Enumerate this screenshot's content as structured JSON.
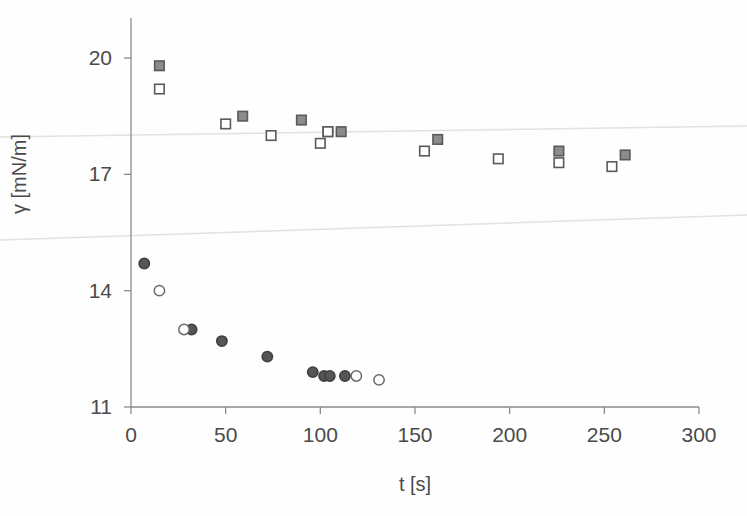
{
  "chart_data": {
    "type": "scatter",
    "title": "",
    "subtitle": "",
    "xlabel": "t [s]",
    "ylabel": "γ [mN/m]",
    "xlim": [
      0,
      300
    ],
    "ylim": [
      11,
      20
    ],
    "xticks": [
      0,
      50,
      100,
      150,
      200,
      250,
      300
    ],
    "yticks": [
      11,
      14,
      17,
      20
    ],
    "xtick_labels": [
      "0",
      "50",
      "100",
      "150",
      "200",
      "250",
      "300"
    ],
    "ytick_labels": [
      "11",
      "14",
      "17",
      "20"
    ],
    "grid": false,
    "legend": "none",
    "axis_color": "#8a8a8a",
    "marker_fill_color": "#8c8c8c",
    "marker_edge_color": "#5a5a5a",
    "marker_open_color": "#ffffff",
    "artifact_line_color": "#e2e2e2",
    "series": [
      {
        "name": "filled-squares",
        "marker": "square",
        "fill": "gray",
        "points": [
          {
            "x": 15.0,
            "y": 19.8
          },
          {
            "x": 59.0,
            "y": 18.5
          },
          {
            "x": 90.0,
            "y": 18.4
          },
          {
            "x": 104.0,
            "y": 18.1
          },
          {
            "x": 111.0,
            "y": 18.1
          },
          {
            "x": 162.0,
            "y": 17.9
          },
          {
            "x": 226.0,
            "y": 17.6
          },
          {
            "x": 261.0,
            "y": 17.5
          }
        ]
      },
      {
        "name": "open-squares",
        "marker": "square",
        "fill": "open",
        "points": [
          {
            "x": 15.0,
            "y": 19.2
          },
          {
            "x": 50.0,
            "y": 18.3
          },
          {
            "x": 74.0,
            "y": 18.0
          },
          {
            "x": 100.0,
            "y": 17.8
          },
          {
            "x": 104.0,
            "y": 18.1
          },
          {
            "x": 155.0,
            "y": 17.6
          },
          {
            "x": 194.0,
            "y": 17.4
          },
          {
            "x": 226.0,
            "y": 17.3
          },
          {
            "x": 254.0,
            "y": 17.2
          }
        ]
      },
      {
        "name": "filled-circles",
        "marker": "circle",
        "fill": "gray",
        "points": [
          {
            "x": 7.0,
            "y": 14.7
          },
          {
            "x": 32.0,
            "y": 13.0
          },
          {
            "x": 48.0,
            "y": 12.7
          },
          {
            "x": 72.0,
            "y": 12.3
          },
          {
            "x": 96.0,
            "y": 11.9
          },
          {
            "x": 102.0,
            "y": 11.8
          },
          {
            "x": 105.0,
            "y": 11.8
          },
          {
            "x": 113.0,
            "y": 11.8
          }
        ]
      },
      {
        "name": "open-circles",
        "marker": "circle",
        "fill": "open",
        "points": [
          {
            "x": 15.0,
            "y": 14.0
          },
          {
            "x": 28.0,
            "y": 13.0
          },
          {
            "x": 119.0,
            "y": 11.8
          },
          {
            "x": 131.0,
            "y": 11.7
          }
        ]
      }
    ],
    "artifact_lines": [
      {
        "name": "upper-scan-line",
        "x1_px": 0,
        "y1_px": 137,
        "x2_px": 747,
        "y2_px": 126
      },
      {
        "name": "lower-scan-line",
        "x1_px": 0,
        "y1_px": 240,
        "x2_px": 747,
        "y2_px": 215
      }
    ]
  }
}
